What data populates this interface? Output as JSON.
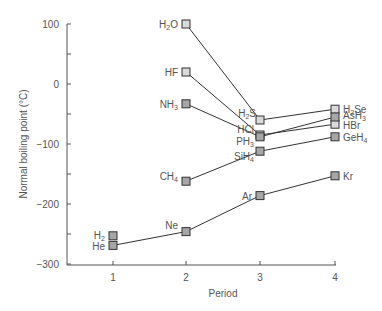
{
  "chart_data": {
    "type": "line",
    "title": "",
    "xlabel": "Period",
    "ylabel": "Normal boiling point (°C)",
    "x": [
      1,
      2,
      3,
      4
    ],
    "xlim": [
      0.4,
      4
    ],
    "ylim": [
      -300,
      100
    ],
    "yticks": [
      100,
      0,
      -100,
      -200,
      -300
    ],
    "ytick_labels": [
      "100",
      "0",
      "−100",
      "−200",
      "−300"
    ],
    "xtick_labels": [
      "1",
      "2",
      "3",
      "4"
    ],
    "grid": false,
    "legend": "none (points labeled directly)",
    "series": [
      {
        "name": "Group 16 hydrides",
        "fill": "#d9d9d9",
        "points": [
          {
            "x": 2,
            "y": 100,
            "label": "H2O",
            "sub": [
              "H",
              "2",
              "O"
            ]
          },
          {
            "x": 3,
            "y": -60,
            "label": "H2S",
            "sub": [
              "H",
              "2",
              "S"
            ]
          },
          {
            "x": 4,
            "y": -42,
            "label": "H2Se",
            "sub": [
              "H",
              "2",
              "Se"
            ]
          }
        ]
      },
      {
        "name": "Group 17 hydrides",
        "fill": "#d9d9d9",
        "points": [
          {
            "x": 2,
            "y": 20,
            "label": "HF",
            "sub": [
              "HF",
              "",
              ""
            ]
          },
          {
            "x": 3,
            "y": -85,
            "label": "HCl",
            "sub": [
              "HCl",
              "",
              ""
            ]
          },
          {
            "x": 4,
            "y": -67,
            "label": "HBr",
            "sub": [
              "HBr",
              "",
              ""
            ]
          }
        ]
      },
      {
        "name": "Group 15 hydrides",
        "fill": "#a6a6a6",
        "points": [
          {
            "x": 2,
            "y": -33,
            "label": "NH3",
            "sub": [
              "NH",
              "3",
              ""
            ]
          },
          {
            "x": 3,
            "y": -88,
            "label": "PH3",
            "sub": [
              "PH",
              "3",
              ""
            ]
          },
          {
            "x": 4,
            "y": -55,
            "label": "AsH3",
            "sub": [
              "AsH",
              "3",
              ""
            ]
          }
        ]
      },
      {
        "name": "Group 14 hydrides",
        "fill": "#a6a6a6",
        "points": [
          {
            "x": 2,
            "y": -162,
            "label": "CH4",
            "sub": [
              "CH",
              "4",
              ""
            ]
          },
          {
            "x": 3,
            "y": -112,
            "label": "SiH4",
            "sub": [
              "SiH",
              "4",
              ""
            ]
          },
          {
            "x": 4,
            "y": -88,
            "label": "GeH4",
            "sub": [
              "GeH",
              "4",
              ""
            ]
          }
        ]
      },
      {
        "name": "Noble gases",
        "fill": "#a6a6a6",
        "points": [
          {
            "x": 1,
            "y": -269,
            "label": "He",
            "sub": [
              "He",
              "",
              ""
            ]
          },
          {
            "x": 2,
            "y": -246,
            "label": "Ne",
            "sub": [
              "Ne",
              "",
              ""
            ]
          },
          {
            "x": 3,
            "y": -186,
            "label": "Ar",
            "sub": [
              "Ar",
              "",
              ""
            ]
          },
          {
            "x": 4,
            "y": -153,
            "label": "Kr",
            "sub": [
              "Kr",
              "",
              ""
            ]
          }
        ]
      },
      {
        "name": "Hydrogen",
        "fill": "#a6a6a6",
        "points": [
          {
            "x": 1,
            "y": -253,
            "label": "H2",
            "sub": [
              "H",
              "2",
              ""
            ]
          }
        ]
      }
    ],
    "label_positions": {
      "H2O": {
        "side": "left",
        "dx": -8,
        "dy": 0
      },
      "H2S": {
        "side": "left",
        "dx": -4,
        "dy": -7
      },
      "H2Se": {
        "side": "right",
        "dx": 8,
        "dy": 0
      },
      "HF": {
        "side": "left",
        "dx": -8,
        "dy": 0
      },
      "HCl": {
        "side": "left",
        "dx": -6,
        "dy": -6
      },
      "HBr": {
        "side": "right",
        "dx": 8,
        "dy": 1
      },
      "NH3": {
        "side": "left",
        "dx": -8,
        "dy": 0
      },
      "PH3": {
        "side": "left",
        "dx": -6,
        "dy": 4
      },
      "AsH3": {
        "side": "right",
        "dx": 8,
        "dy": -2
      },
      "CH4": {
        "side": "left",
        "dx": -8,
        "dy": -5
      },
      "SiH4": {
        "side": "left",
        "dx": -6,
        "dy": 5
      },
      "GeH4": {
        "side": "right",
        "dx": 8,
        "dy": 0
      },
      "He": {
        "side": "left",
        "dx": -8,
        "dy": 1
      },
      "Ne": {
        "side": "left",
        "dx": -8,
        "dy": -7
      },
      "Ar": {
        "side": "left",
        "dx": -8,
        "dy": 0
      },
      "Kr": {
        "side": "right",
        "dx": 8,
        "dy": 0
      },
      "H2": {
        "side": "left",
        "dx": -8,
        "dy": -1
      }
    }
  },
  "colors": {
    "axis": "#555555",
    "line": "#333333",
    "text": "#555555",
    "marker_stroke": "#333333"
  }
}
